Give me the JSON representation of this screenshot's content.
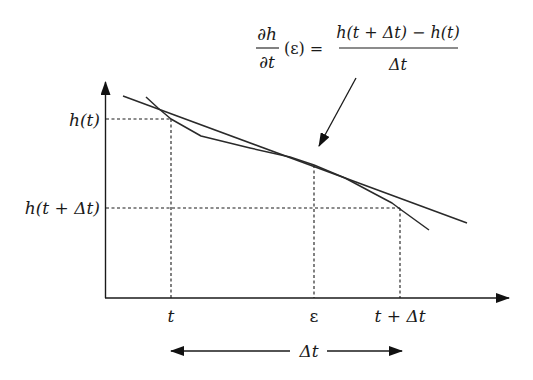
{
  "formula": {
    "lhs_numerator": "∂h",
    "lhs_denominator": "∂t",
    "lhs_argument": "(ε) =",
    "rhs_numerator": "h(t + Δt) − h(t)",
    "rhs_denominator": "Δt"
  },
  "y_axis": {
    "tick_labels": [
      "h(t)",
      "h(t + Δt)"
    ]
  },
  "x_axis": {
    "tick_labels": [
      "t",
      "ε",
      "t + Δt"
    ]
  },
  "interval": {
    "label": "Δt"
  },
  "colors": {
    "ink": "#1a1a1a",
    "background": "#ffffff"
  }
}
